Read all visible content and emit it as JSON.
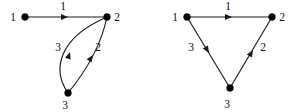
{
  "figure": {
    "type": "directed-graph-pair",
    "background_color": "#ffffff",
    "ink_color": "#1a1a1a",
    "width": 297,
    "height": 112
  },
  "graphs": [
    {
      "id": "left-graph",
      "name": "curved-edge-digraph",
      "nodes": [
        {
          "id": "n1",
          "label": "1",
          "x": 25,
          "y": 17,
          "label_x": 13,
          "label_y": 21
        },
        {
          "id": "n2",
          "label": "2",
          "x": 107,
          "y": 17,
          "label_x": 117,
          "label_y": 21
        },
        {
          "id": "n3",
          "label": "3",
          "x": 68,
          "y": 93,
          "label_x": 65,
          "label_y": 109
        }
      ],
      "edges": [
        {
          "id": "e1",
          "label": "1",
          "from": "n1",
          "to": "n2",
          "shape": "straight",
          "label_x": 63,
          "label_y": 10,
          "arrow_x": 62,
          "arrow_y": 17,
          "arrow_angle": 0
        },
        {
          "id": "e3",
          "label": "3",
          "from": "n3",
          "to": "n2",
          "shape": "curve-left",
          "label_x": 58,
          "label_y": 51,
          "arrow_x": 69,
          "arrow_y": 52,
          "arrow_angle": -70
        },
        {
          "id": "e2",
          "label": "2",
          "from": "n3",
          "to": "n2",
          "shape": "curve-right",
          "label_x": 98,
          "label_y": 51,
          "arrow_x": 90,
          "arrow_y": 52,
          "arrow_angle": -47
        }
      ]
    },
    {
      "id": "right-graph",
      "name": "triangle-digraph",
      "nodes": [
        {
          "id": "n1",
          "label": "1",
          "x": 187,
          "y": 17,
          "label_x": 175,
          "label_y": 21
        },
        {
          "id": "n2",
          "label": "2",
          "x": 272,
          "y": 17,
          "label_x": 282,
          "label_y": 21
        },
        {
          "id": "n3",
          "label": "3",
          "x": 230,
          "y": 88,
          "label_x": 227,
          "label_y": 108
        }
      ],
      "edges": [
        {
          "id": "e1",
          "label": "1",
          "from": "n1",
          "to": "n2",
          "shape": "straight",
          "label_x": 228,
          "label_y": 10,
          "arrow_x": 226,
          "arrow_y": 17,
          "arrow_angle": 0
        },
        {
          "id": "e3",
          "label": "3",
          "from": "n1",
          "to": "n3",
          "shape": "straight",
          "label_x": 191,
          "label_y": 51,
          "arrow_x": 207,
          "arrow_y": 52,
          "arrow_angle": 60
        },
        {
          "id": "e2",
          "label": "2",
          "from": "n3",
          "to": "n2",
          "shape": "straight",
          "label_x": 263,
          "label_y": 51,
          "arrow_x": 252,
          "arrow_y": 53,
          "arrow_angle": -60
        }
      ]
    }
  ]
}
